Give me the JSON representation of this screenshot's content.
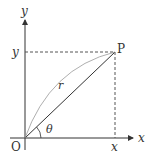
{
  "diagram": {
    "title": "",
    "colors": {
      "axis": "#333333",
      "segment": "#333333",
      "arc": "#888888",
      "dashed": "#555555",
      "background": "#ffffff"
    },
    "labels": {
      "y_axis": "y",
      "x_axis": "x",
      "origin": "O",
      "point": "P",
      "y_tick": "y",
      "x_tick": "x",
      "radius": "r",
      "angle": "θ"
    },
    "geometry": {
      "origin": [
        25,
        138
      ],
      "point_P": [
        115,
        52
      ],
      "y_axis_top": [
        25,
        18
      ],
      "y_axis_bottom": [
        25,
        150
      ],
      "x_axis_left": [
        10,
        138
      ],
      "x_axis_right": [
        135,
        138
      ]
    }
  }
}
